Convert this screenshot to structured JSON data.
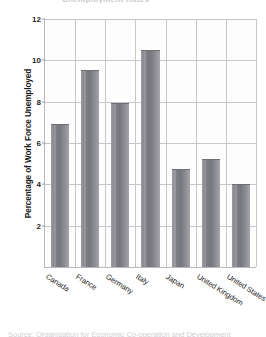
{
  "figure": {
    "title_remnant": "Unemployment Rates",
    "source_remnant": "Source: Organisation for Economic Co-operation and Development"
  },
  "chart_data": {
    "type": "bar",
    "title": "",
    "xlabel": "",
    "ylabel": "Percentage of Work Force Unemployed",
    "categories": [
      "Canada",
      "France",
      "Germany",
      "Italy",
      "Japan",
      "United Kingdom",
      "United States"
    ],
    "values": [
      6.85,
      9.5,
      7.9,
      10.45,
      4.7,
      5.2,
      3.95
    ],
    "ylim": [
      0,
      12
    ],
    "yticks": [
      2,
      4,
      6,
      8,
      10,
      12
    ],
    "ytick_labels": [
      "2",
      "4",
      "6",
      "8",
      "10",
      "12"
    ],
    "grid": true,
    "legend": "none",
    "bar_color": "#7f7f86",
    "grid_color": "#c6c6cc",
    "axis_color": "#b8b8bd",
    "plot_background": "#fdfdfd"
  }
}
